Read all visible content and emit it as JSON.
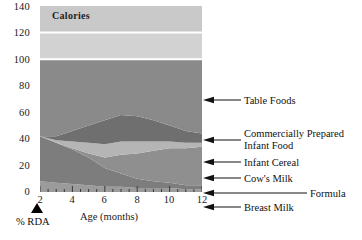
{
  "chart_data": {
    "type": "area",
    "title": "Calories",
    "xlabel": "Age (months)",
    "ylabel": "% RDA",
    "x": [
      2,
      3,
      4,
      5,
      6,
      7,
      8,
      9,
      10,
      11,
      12
    ],
    "xlim": [
      2,
      12
    ],
    "ylim": [
      0,
      140
    ],
    "xticks": [
      2,
      4,
      6,
      8,
      10,
      12
    ],
    "yticks": [
      0,
      20,
      40,
      60,
      80,
      100,
      120,
      140
    ],
    "grid": false,
    "legend_position": "right-callouts",
    "stack_total": 100,
    "series": [
      {
        "name": "Breast Milk",
        "color": "#9b9b9b",
        "values": [
          8,
          7,
          6,
          5,
          4,
          4,
          3,
          3,
          3,
          2,
          2
        ]
      },
      {
        "name": "Formula",
        "color": "#7d7d7d",
        "values": [
          34,
          30,
          26,
          21,
          14,
          10,
          7,
          5,
          4,
          3,
          3
        ]
      },
      {
        "name": "Cow's Milk",
        "color": "#8f8f8f",
        "values": [
          0,
          0,
          1,
          3,
          8,
          14,
          19,
          23,
          26,
          28,
          29
        ]
      },
      {
        "name": "Infant Cereal",
        "color": "#b5b5b5",
        "values": [
          0,
          2,
          5,
          8,
          10,
          10,
          9,
          7,
          5,
          4,
          3
        ]
      },
      {
        "name": "Commercially Prepared Infant Food",
        "color": "#6f6f6f",
        "values": [
          0,
          3,
          8,
          13,
          18,
          20,
          19,
          16,
          12,
          9,
          7
        ]
      },
      {
        "name": "Table Foods",
        "color": "#8a8a8a",
        "values": [
          58,
          58,
          54,
          50,
          46,
          42,
          43,
          46,
          50,
          54,
          56
        ]
      }
    ],
    "upper_bands": [
      {
        "from": 100,
        "to": 120,
        "color": "#d2d2d2"
      },
      {
        "from": 120,
        "to": 140,
        "color": "#c9c9c9"
      }
    ]
  },
  "axes": {
    "y_tick_labels": [
      "140",
      "120",
      "100",
      "80",
      "60",
      "40",
      "20",
      "0"
    ],
    "x_tick_labels": [
      "2",
      "4",
      "6",
      "8",
      "10",
      "12"
    ],
    "x_axis_title": "Age (months)",
    "y_axis_title": "% RDA"
  },
  "callouts": [
    {
      "key": "table_foods",
      "text": "Table Foods"
    },
    {
      "key": "comm_prep",
      "line1": "Commercially Prepared",
      "line2": "Infant Food"
    },
    {
      "key": "infant_cereal",
      "text": "Infant Cereal"
    },
    {
      "key": "cows_milk",
      "text": "Cow's Milk"
    },
    {
      "key": "formula",
      "text": "Formula"
    },
    {
      "key": "breast_milk",
      "text": "Breast Milk"
    }
  ],
  "plot_title": "Calories"
}
